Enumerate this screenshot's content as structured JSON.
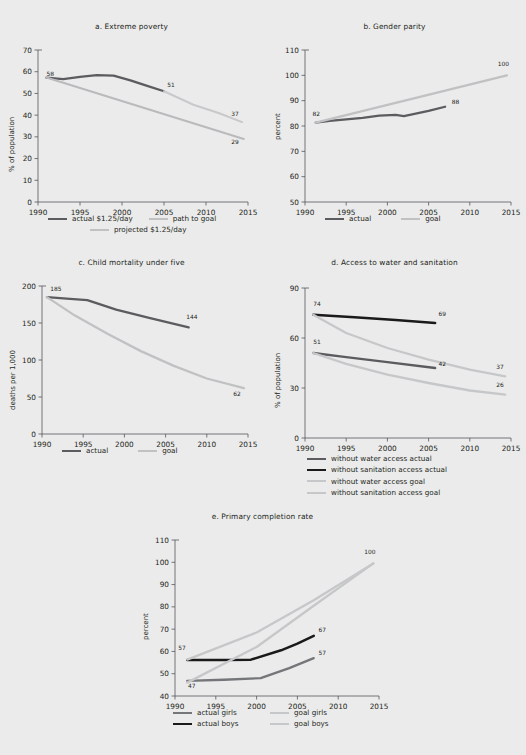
{
  "figure": {
    "background": "#ebebeb",
    "colors": {
      "dark_gray": "#5c5c60",
      "black": "#1a1a1a",
      "mid_gray": "#8f9094",
      "light_gray": "#c0c1c3",
      "lighter_gray": "#cdced0",
      "axis": "#55565a"
    }
  },
  "panels": [
    {
      "id": "a",
      "title": "a.  Extreme poverty",
      "chart_data": {
        "type": "line",
        "title": "a.  Extreme poverty",
        "xlabel": "",
        "ylabel": "% of population",
        "xlim": [
          1990,
          2015
        ],
        "ylim": [
          0,
          70
        ],
        "xticks": [
          1990,
          1995,
          2000,
          2005,
          2010,
          2015
        ],
        "yticks": [
          0,
          10,
          20,
          30,
          40,
          50,
          60,
          70
        ],
        "grid": false,
        "legend_position": "below",
        "annotations": [
          {
            "text": "58",
            "x": 1991.0,
            "y": 58
          },
          {
            "text": "51",
            "x": 2005.4,
            "y": 53
          },
          {
            "text": "37",
            "x": 2013.0,
            "y": 39.5
          },
          {
            "text": "29",
            "x": 2013.0,
            "y": 26.5
          }
        ],
        "series": [
          {
            "name": "actual $1.25/day",
            "color": "#5c5c60",
            "width": 2.3,
            "x": [
              1991,
              1993,
              1995,
              1997,
              1999,
              2001,
              2003,
              2005
            ],
            "values": [
              57.3,
              56.6,
              57.6,
              58.4,
              58.2,
              56.0,
              53.5,
              51.0
            ]
          },
          {
            "name": "path to goal",
            "color": "#b9babc",
            "width": 2.0,
            "x": [
              1991,
              2014.5
            ],
            "values": [
              57.3,
              29.0
            ]
          },
          {
            "name": "projected $1.25/day",
            "color": "#c8c9cb",
            "width": 2.0,
            "x": [
              2005,
              2008.5,
              2011.5,
              2014.3
            ],
            "values": [
              51.0,
              44.8,
              41.0,
              36.8
            ]
          }
        ]
      },
      "legend": [
        {
          "label": "actual $1.25/day",
          "color": "#5c5c60",
          "width": 2.6
        },
        {
          "label": "path to goal",
          "color": "#c0c1c3",
          "width": 2.3
        },
        {
          "label": "projected $1.25/day",
          "color": "#c0c1c3",
          "width": 2.3
        }
      ]
    },
    {
      "id": "b",
      "title": "b.  Gender parity",
      "chart_data": {
        "type": "line",
        "title": "b.  Gender parity",
        "xlabel": "",
        "ylabel": "percent",
        "xlim": [
          1990,
          2015
        ],
        "ylim": [
          50,
          110
        ],
        "xticks": [
          1990,
          1995,
          2000,
          2005,
          2010,
          2015
        ],
        "yticks": [
          50,
          60,
          70,
          80,
          90,
          100,
          110
        ],
        "grid": false,
        "legend_position": "below",
        "annotations": [
          {
            "text": "82",
            "x": 1990.9,
            "y": 84.0
          },
          {
            "text": "88",
            "x": 2007.8,
            "y": 88.5
          },
          {
            "text": "100",
            "x": 2013.4,
            "y": 103.5
          }
        ],
        "series": [
          {
            "name": "actual",
            "color": "#5c5c60",
            "width": 2.3,
            "x": [
              1991.3,
              1993,
              1995,
              1997,
              1999,
              2001,
              2002,
              2003,
              2005,
              2007
            ],
            "values": [
              81.3,
              82.0,
              82.6,
              83.2,
              84.1,
              84.4,
              83.9,
              84.6,
              86.0,
              87.6
            ]
          },
          {
            "name": "goal",
            "color": "#c0c1c3",
            "width": 2.3,
            "x": [
              1991.3,
              2014.5
            ],
            "values": [
              81.3,
              100.0
            ]
          }
        ]
      },
      "legend": [
        {
          "label": "actual",
          "color": "#5c5c60",
          "width": 2.6
        },
        {
          "label": "goal",
          "color": "#c0c1c3",
          "width": 2.3
        }
      ]
    },
    {
      "id": "c",
      "title": "c.  Child mortality under five",
      "chart_data": {
        "type": "line",
        "title": "c.  Child mortality under five",
        "xlabel": "",
        "ylabel": "deaths per 1,000",
        "xlim": [
          1990,
          2015
        ],
        "ylim": [
          0,
          200
        ],
        "xticks": [
          1990,
          1995,
          2000,
          2005,
          2010,
          2015
        ],
        "yticks": [
          0,
          50,
          100,
          150,
          200
        ],
        "grid": false,
        "legend_position": "below",
        "annotations": [
          {
            "text": "185",
            "x": 1991.0,
            "y": 193
          },
          {
            "text": "144",
            "x": 2007.5,
            "y": 155
          },
          {
            "text": "62",
            "x": 2013.2,
            "y": 52
          }
        ],
        "series": [
          {
            "name": "actual",
            "color": "#5c5c60",
            "width": 2.3,
            "x": [
              1990.6,
              1993,
              1995.5,
              1999,
              2003,
              2007.8
            ],
            "values": [
              185,
              183,
              181,
              168,
              157,
              144
            ]
          },
          {
            "name": "goal",
            "color": "#c0c1c3",
            "width": 2.3,
            "x": [
              1990.6,
              1994,
              1998,
              2002,
              2006,
              2010,
              2014.5
            ],
            "values": [
              185,
              160,
              135,
              112,
              92,
              75,
              62
            ]
          }
        ]
      },
      "legend": [
        {
          "label": "actual",
          "color": "#5c5c60",
          "width": 2.6
        },
        {
          "label": "goal",
          "color": "#c0c1c3",
          "width": 2.3
        }
      ]
    },
    {
      "id": "d",
      "title": "d.  Access to water and sanitation",
      "chart_data": {
        "type": "line",
        "title": "d.  Access to water and sanitation",
        "xlabel": "",
        "ylabel": "% of population",
        "xlim": [
          1990,
          2015
        ],
        "ylim": [
          0,
          90
        ],
        "xticks": [
          1990,
          1995,
          2000,
          2005,
          2010,
          2015
        ],
        "yticks": [
          0,
          30,
          60,
          90
        ],
        "grid": false,
        "legend_position": "below",
        "annotations": [
          {
            "text": "74",
            "x": 1991.0,
            "y": 79.5
          },
          {
            "text": "69",
            "x": 2006.2,
            "y": 73.5
          },
          {
            "text": "51",
            "x": 1991.0,
            "y": 56.5
          },
          {
            "text": "42",
            "x": 2006.2,
            "y": 43.5
          },
          {
            "text": "37",
            "x": 2013.2,
            "y": 41.5
          },
          {
            "text": "26",
            "x": 2013.2,
            "y": 30.5
          }
        ],
        "series": [
          {
            "name": "without water access actual",
            "color": "#5c5c60",
            "width": 2.3,
            "x": [
              1991,
              1995,
              2000,
              2005.8
            ],
            "values": [
              51,
              48.5,
              45.5,
              42
            ]
          },
          {
            "name": "without sanitation access actual",
            "color": "#1a1a1a",
            "width": 2.5,
            "x": [
              1991,
              1996,
              2001,
              2005.8
            ],
            "values": [
              74,
              72.5,
              70.8,
              69
            ]
          },
          {
            "name": "without water access goal",
            "color": "#c6c7c9",
            "width": 2.3,
            "x": [
              1991,
              1995,
              2000,
              2005,
              2010,
              2014.3
            ],
            "values": [
              74,
              63,
              54,
              47,
              41,
              37
            ]
          },
          {
            "name": "without sanitation access goal",
            "color": "#c6c7c9",
            "width": 2.3,
            "x": [
              1991,
              1995,
              2000,
              2005,
              2010,
              2014.3
            ],
            "values": [
              51,
              44.5,
              38,
              33,
              28.5,
              26
            ]
          }
        ]
      },
      "legend": [
        {
          "label": "without water access actual",
          "color": "#5c5c60",
          "width": 2.6
        },
        {
          "label": "without sanitation access actual",
          "color": "#1a1a1a",
          "width": 2.8
        },
        {
          "label": "without water access goal",
          "color": "#c6c7c9",
          "width": 2.3
        },
        {
          "label": "without sanitation access goal",
          "color": "#c6c7c9",
          "width": 2.3
        }
      ]
    },
    {
      "id": "e",
      "title": "e.  Primary completion rate",
      "chart_data": {
        "type": "line",
        "title": "e.  Primary completion rate",
        "xlabel": "",
        "ylabel": "percent",
        "xlim": [
          1990,
          2015
        ],
        "ylim": [
          40,
          110
        ],
        "xticks": [
          1990,
          1995,
          2000,
          2005,
          2010,
          2015
        ],
        "yticks": [
          40,
          50,
          60,
          70,
          80,
          90,
          100,
          110
        ],
        "grid": false,
        "legend_position": "below",
        "annotations": [
          {
            "text": "57",
            "x": 1990.4,
            "y": 60.5
          },
          {
            "text": "47",
            "x": 1991.6,
            "y": 43.5
          },
          {
            "text": "67",
            "x": 2007.6,
            "y": 68.5
          },
          {
            "text": "57",
            "x": 2007.6,
            "y": 58.5
          },
          {
            "text": "100",
            "x": 2013.2,
            "y": 103.5
          }
        ],
        "series": [
          {
            "name": "actual girls",
            "color": "#75767a",
            "width": 2.3,
            "x": [
              1991.5,
              1996,
              2000.5,
              2004,
              2007
            ],
            "values": [
              46.8,
              47.3,
              48.0,
              52.5,
              57.0
            ]
          },
          {
            "name": "actual boys",
            "color": "#1a1a1a",
            "width": 2.5,
            "x": [
              1991.5,
              1996,
              1999.3,
              2003,
              2005,
              2007
            ],
            "values": [
              56.2,
              56.2,
              56.3,
              60.5,
              63.5,
              67.0
            ]
          },
          {
            "name": "goal girls",
            "color": "#c6c7c9",
            "width": 2.3,
            "x": [
              1991.5,
              2000,
              2007,
              2014.3
            ],
            "values": [
              46.0,
              62.0,
              80.5,
              99.5
            ]
          },
          {
            "name": "goal boys",
            "color": "#c6c7c9",
            "width": 2.3,
            "x": [
              1991.5,
              2000,
              2007,
              2014.3
            ],
            "values": [
              56.3,
              68.5,
              83.0,
              99.5
            ]
          }
        ]
      },
      "legend": [
        {
          "label": "actual girls",
          "color": "#75767a",
          "width": 2.6
        },
        {
          "label": "actual boys",
          "color": "#1a1a1a",
          "width": 2.8
        },
        {
          "label": "goal girls",
          "color": "#c6c7c9",
          "width": 2.3
        },
        {
          "label": "goal boys",
          "color": "#c6c7c9",
          "width": 2.3
        }
      ]
    }
  ]
}
